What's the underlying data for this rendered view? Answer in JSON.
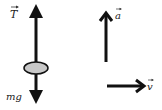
{
  "diagram": {
    "type": "free-body-diagram",
    "labels": {
      "tension": "T",
      "weight": "mg",
      "acceleration": "a",
      "velocity": "v"
    },
    "colors": {
      "stroke": "#111111",
      "body_fill": "#c8c8c8"
    }
  }
}
